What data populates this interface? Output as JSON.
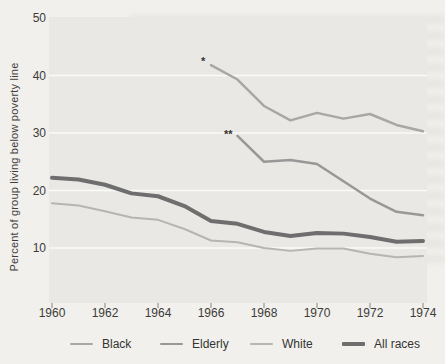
{
  "colors": {
    "paper": "#f1f0ed",
    "plot_bg": "#e9e8e4",
    "grid": "#fafaf8",
    "tick_mark": "#85847f",
    "text": "#3c3b38"
  },
  "chart_data": {
    "type": "line",
    "title": "",
    "xlabel": "",
    "ylabel": "Percent of group living below poverty line",
    "xlim": [
      1959.9,
      1974.15
    ],
    "ylim": [
      0,
      50
    ],
    "x_ticks": [
      1960,
      1962,
      1964,
      1966,
      1968,
      1970,
      1972,
      1974
    ],
    "y_ticks": [
      50,
      40,
      30,
      20,
      10
    ],
    "grid": "horizontal white lines at 10,20,30,40",
    "legend_position": "bottom",
    "series": [
      {
        "name": "Black",
        "color": "#a7a7a7",
        "width": 2.5,
        "x": [
          1966,
          1967,
          1968,
          1969,
          1970,
          1971,
          1972,
          1973,
          1974
        ],
        "values": [
          41.8,
          39.3,
          34.7,
          32.2,
          33.5,
          32.5,
          33.3,
          31.4,
          30.3
        ]
      },
      {
        "name": "Elderly",
        "color": "#989898",
        "width": 2.5,
        "x": [
          1967,
          1968,
          1969,
          1970,
          1971,
          1972,
          1973,
          1974
        ],
        "values": [
          29.5,
          25.0,
          25.3,
          24.6,
          21.6,
          18.6,
          16.3,
          15.7
        ]
      },
      {
        "name": "White",
        "color": "#b5b5b3",
        "width": 2,
        "x": [
          1960,
          1961,
          1962,
          1963,
          1964,
          1965,
          1966,
          1967,
          1968,
          1969,
          1970,
          1971,
          1972,
          1973,
          1974
        ],
        "values": [
          17.8,
          17.4,
          16.4,
          15.3,
          14.9,
          13.3,
          11.3,
          11.0,
          10.0,
          9.5,
          9.9,
          9.9,
          9.0,
          8.4,
          8.6
        ]
      },
      {
        "name": "All races",
        "color": "#6e6e6e",
        "width": 4,
        "x": [
          1960,
          1961,
          1962,
          1963,
          1964,
          1965,
          1966,
          1967,
          1968,
          1969,
          1970,
          1971,
          1972,
          1973,
          1974
        ],
        "values": [
          22.2,
          21.9,
          21.0,
          19.5,
          19.0,
          17.3,
          14.7,
          14.2,
          12.8,
          12.1,
          12.6,
          12.5,
          11.9,
          11.1,
          11.2
        ]
      }
    ],
    "annotations": [
      {
        "text": "*",
        "x": 1965.7,
        "y": 42.9
      },
      {
        "text": "**",
        "x": 1966.65,
        "y": 30.2
      }
    ]
  }
}
